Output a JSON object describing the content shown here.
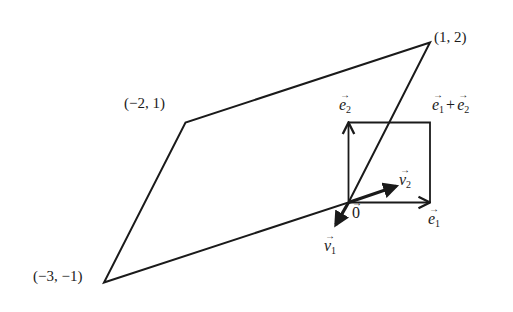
{
  "diagram": {
    "parallelogram_vertices": [
      {
        "x": 0,
        "y": 0
      },
      {
        "x": 1,
        "y": 2
      },
      {
        "x": -2,
        "y": 1
      },
      {
        "x": -3,
        "y": -1
      }
    ],
    "unit_square_vertices": [
      {
        "x": 0,
        "y": 0
      },
      {
        "x": 1,
        "y": 0
      },
      {
        "x": 1,
        "y": 1
      },
      {
        "x": 0,
        "y": 1
      }
    ],
    "vectors": {
      "e1": {
        "x": 1,
        "y": 0
      },
      "e2": {
        "x": 0,
        "y": 1
      },
      "v1": {
        "x": -0.18,
        "y": -0.32
      },
      "v2": {
        "x": 0.63,
        "y": 0.22
      }
    },
    "labels": {
      "vertex_1_2": "(1, 2)",
      "vertex_m2_1": "(−2, 1)",
      "vertex_m3_m1": "(−3, −1)",
      "origin_letter": "0",
      "e_letter": "e",
      "v_letter": "v",
      "sub1": "1",
      "sub2": "2",
      "plus": "+",
      "arrow": "→"
    },
    "color": "#1a1a1a"
  }
}
